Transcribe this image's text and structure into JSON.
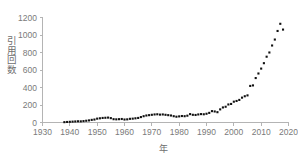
{
  "chart_data": {
    "type": "scatter",
    "title": "",
    "subtitle": "",
    "xlabel": "年",
    "ylabel": "引用回数",
    "ylabel_chars": [
      "引",
      "用",
      "回",
      "数"
    ],
    "xlim": [
      1930,
      2020
    ],
    "ylim": [
      0,
      1200
    ],
    "xticks": [
      1930,
      1940,
      1950,
      1960,
      1970,
      1980,
      1990,
      2000,
      2010,
      2020
    ],
    "yticks": [
      0,
      200,
      400,
      600,
      800,
      1000,
      1200
    ],
    "xtick_labels": [
      "1930",
      "1940",
      "1950",
      "1960",
      "1970",
      "1980",
      "1990",
      "2000",
      "2010",
      "2020"
    ],
    "ytick_labels": [
      "0",
      "200",
      "400",
      "600",
      "800",
      "1000",
      "1200"
    ],
    "grid": false,
    "legend": null,
    "marker": "square",
    "marker_color": "#111111",
    "axis_color": "#b4b4b4",
    "text_color": "#6e6e6e",
    "background": "#ffffff",
    "x": [
      1938,
      1939,
      1940,
      1941,
      1942,
      1943,
      1944,
      1945,
      1946,
      1947,
      1948,
      1949,
      1950,
      1951,
      1952,
      1953,
      1954,
      1955,
      1956,
      1957,
      1958,
      1959,
      1960,
      1961,
      1962,
      1963,
      1964,
      1965,
      1966,
      1967,
      1968,
      1969,
      1970,
      1971,
      1972,
      1973,
      1974,
      1975,
      1976,
      1977,
      1978,
      1979,
      1980,
      1981,
      1982,
      1983,
      1984,
      1985,
      1986,
      1987,
      1988,
      1989,
      1990,
      1991,
      1992,
      1993,
      1994,
      1995,
      1996,
      1997,
      1998,
      1999,
      2000,
      2001,
      2002,
      2003,
      2004,
      2005,
      2006,
      2007,
      2008,
      2009,
      2010,
      2011,
      2012,
      2013,
      2014,
      2015,
      2016,
      2017,
      2018
    ],
    "values": [
      4,
      6,
      8,
      10,
      12,
      14,
      13,
      16,
      20,
      24,
      30,
      34,
      44,
      48,
      52,
      54,
      56,
      50,
      38,
      36,
      38,
      40,
      34,
      36,
      42,
      44,
      48,
      52,
      62,
      72,
      80,
      84,
      88,
      92,
      94,
      90,
      92,
      88,
      84,
      80,
      72,
      66,
      70,
      74,
      72,
      78,
      96,
      88,
      86,
      92,
      96,
      94,
      100,
      110,
      130,
      126,
      118,
      150,
      172,
      180,
      206,
      212,
      238,
      246,
      258,
      284,
      300,
      310,
      418,
      424,
      508,
      560,
      616,
      678,
      752,
      800,
      880,
      948,
      1046,
      1128,
      1062
    ],
    "y_unit": "citations"
  },
  "chart_meta": {
    "description": "Scatter plot of citation counts per year from the late 1930s to 2018"
  }
}
